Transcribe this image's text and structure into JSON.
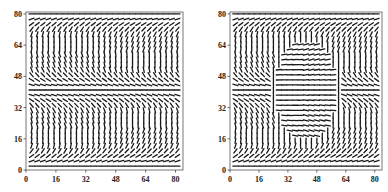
{
  "figure": {
    "background": "#ffffff",
    "stroke_color": "#1a1a1a",
    "frame_color": "#555555"
  },
  "chart_data": [
    {
      "type": "vector_field",
      "title": "",
      "xlabel": "",
      "ylabel": "",
      "xlim": [
        0,
        84
      ],
      "ylim": [
        0,
        81
      ],
      "x_ticks": [
        "0",
        "16",
        "32",
        "48",
        "64",
        "80"
      ],
      "y_ticks": [
        "0",
        "16",
        "32",
        "48",
        "64",
        "80"
      ],
      "x_tick_values": [
        0,
        16,
        32,
        48,
        64,
        80
      ],
      "y_tick_values": [
        0,
        16,
        32,
        48,
        64,
        80
      ],
      "grid": false,
      "pattern": "layered",
      "description": "Director/vector field of short line segments; horizontal rows at y≈2, y≈40-42 and y≈80, near-vertical tilted strokes in the bands between (tilt reverses across the midplane).",
      "grid_spacing": {
        "dx": 3,
        "dy": 2.6
      },
      "field_rows_x_range": [
        3,
        82
      ],
      "field_rows_y_range": [
        2,
        80
      ]
    },
    {
      "type": "vector_field",
      "title": "",
      "xlabel": "",
      "ylabel": "",
      "xlim": [
        0,
        84
      ],
      "ylim": [
        0,
        81
      ],
      "x_ticks": [
        "0",
        "16",
        "32",
        "48",
        "64",
        "80"
      ],
      "y_ticks": [
        "0",
        "16",
        "32",
        "48",
        "64",
        "80"
      ],
      "x_tick_values": [
        0,
        16,
        32,
        48,
        64,
        80
      ],
      "y_tick_values": [
        0,
        16,
        32,
        48,
        64,
        80
      ],
      "grid": false,
      "pattern": "layered_with_defect",
      "description": "Same layered field but with a central elliptical region (x≈26–58, y≈16–66) of mostly horizontal segments curving around a defect, bordered by vertical walls at x≈26 and x≈58.",
      "grid_spacing": {
        "dx": 3,
        "dy": 2.6
      },
      "field_rows_x_range": [
        3,
        82
      ],
      "field_rows_y_range": [
        2,
        80
      ],
      "defect": {
        "cx": 42,
        "cy": 41,
        "rx": 17,
        "ry": 26
      }
    }
  ]
}
